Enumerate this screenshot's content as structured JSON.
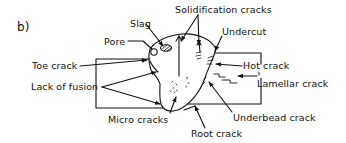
{
  "figure": {
    "panel_label": "b)"
  },
  "labels": {
    "slag": "Slag",
    "pore": "Pore",
    "solidification_cracks": "Solidification cracks",
    "undercut": "Undercut",
    "toe_crack": "Toe crack",
    "hot_crack": "Hot crack",
    "lamellar_crack": "Lamellar crack",
    "lack_of_fusion": "Lack of fusion",
    "underbead_crack": "Underbead crack",
    "micro_cracks": "Micro cracks",
    "root_crack": "Root crack"
  },
  "colors": {
    "line": "#111111",
    "background": "#ffffff"
  }
}
